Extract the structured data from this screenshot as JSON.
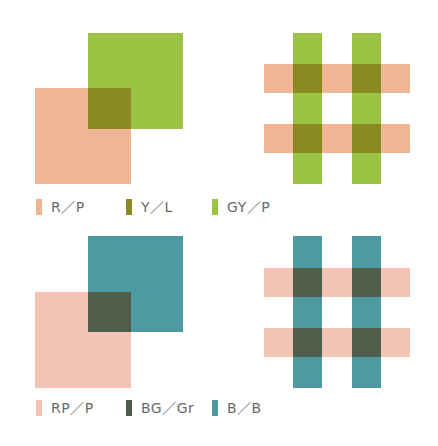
{
  "colors": {
    "salmon": "#eeb692",
    "green": "#9cc444",
    "olive": "#8a8a22",
    "pink": "#f2c4b6",
    "teal": "#4e9aa2",
    "darkgreen": "#4f5e4a",
    "label": "#6a6a6a"
  },
  "top_row": {
    "overlap_squares": {
      "back_square": {
        "color": "green",
        "x": 88,
        "y": 33,
        "w": 95,
        "h": 96
      },
      "front_square": {
        "color": "salmon",
        "x": 35,
        "y": 88,
        "w": 96,
        "h": 96
      },
      "overlap": {
        "color": "olive",
        "x": 88,
        "y": 88,
        "w": 43,
        "h": 41
      }
    },
    "grid_pattern": {
      "vertical_bars": [
        {
          "color": "green",
          "x": 293,
          "y": 33,
          "w": 29,
          "h": 151
        },
        {
          "color": "green",
          "x": 352,
          "y": 33,
          "w": 29,
          "h": 151
        }
      ],
      "horizontal_bars": [
        {
          "color": "salmon",
          "x": 264,
          "y": 64,
          "w": 146,
          "h": 29
        },
        {
          "color": "salmon",
          "x": 264,
          "y": 124,
          "w": 146,
          "h": 29
        }
      ],
      "intersections": [
        {
          "color": "olive",
          "x": 293,
          "y": 64,
          "w": 29,
          "h": 29
        },
        {
          "color": "olive",
          "x": 352,
          "y": 64,
          "w": 29,
          "h": 29
        },
        {
          "color": "olive",
          "x": 293,
          "y": 124,
          "w": 29,
          "h": 29
        },
        {
          "color": "olive",
          "x": 352,
          "y": 124,
          "w": 29,
          "h": 29
        }
      ]
    },
    "legend": [
      {
        "label": "R／P",
        "color": "#eeb692",
        "x": 36,
        "y": 199
      },
      {
        "label": "Y／L",
        "color": "#8a8a22",
        "x": 126,
        "y": 199
      },
      {
        "label": "GY／P",
        "color": "#9cc444",
        "x": 212,
        "y": 199
      }
    ]
  },
  "bottom_row": {
    "overlap_squares": {
      "back_square": {
        "color": "teal",
        "x": 88,
        "y": 236,
        "w": 95,
        "h": 96
      },
      "front_square": {
        "color": "pink",
        "x": 35,
        "y": 292,
        "w": 96,
        "h": 96
      },
      "overlap": {
        "color": "darkgreen",
        "x": 88,
        "y": 292,
        "w": 43,
        "h": 40
      }
    },
    "grid_pattern": {
      "vertical_bars": [
        {
          "color": "teal",
          "x": 293,
          "y": 236,
          "w": 29,
          "h": 152
        },
        {
          "color": "teal",
          "x": 352,
          "y": 236,
          "w": 29,
          "h": 152
        }
      ],
      "horizontal_bars": [
        {
          "color": "pink",
          "x": 264,
          "y": 268,
          "w": 146,
          "h": 29
        },
        {
          "color": "pink",
          "x": 264,
          "y": 328,
          "w": 146,
          "h": 29
        }
      ],
      "intersections": [
        {
          "color": "darkgreen",
          "x": 293,
          "y": 268,
          "w": 29,
          "h": 29
        },
        {
          "color": "darkgreen",
          "x": 352,
          "y": 268,
          "w": 29,
          "h": 29
        },
        {
          "color": "darkgreen",
          "x": 293,
          "y": 328,
          "w": 29,
          "h": 29
        },
        {
          "color": "darkgreen",
          "x": 352,
          "y": 328,
          "w": 29,
          "h": 29
        }
      ]
    },
    "legend": [
      {
        "label": "RP／P",
        "color": "#f2c4b6",
        "x": 36,
        "y": 400
      },
      {
        "label": "BG／Gr",
        "color": "#4f5e4a",
        "x": 126,
        "y": 400
      },
      {
        "label": "B／B",
        "color": "#4e9aa2",
        "x": 212,
        "y": 400
      }
    ]
  }
}
